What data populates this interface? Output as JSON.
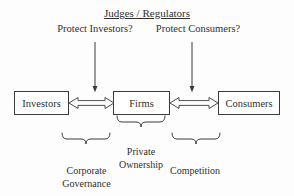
{
  "diagram": {
    "title": "Judges / Regulators",
    "type": "flow-diagram",
    "background_color": "#fdfdfd",
    "line_color": "#3a3a3a",
    "text_color": "#303030",
    "questions": [
      {
        "id": "investors-question",
        "text": "Protect Investors?"
      },
      {
        "id": "consumers-question",
        "text": "Protect Consumers?"
      }
    ],
    "boxes": [
      {
        "id": "investors",
        "label": "Investors"
      },
      {
        "id": "firms",
        "label": "Firms"
      },
      {
        "id": "consumers",
        "label": "Consumers"
      }
    ],
    "brace_labels": [
      {
        "id": "private-ownership",
        "line1": "Private",
        "line2": "Ownership"
      },
      {
        "id": "corporate-governance",
        "line1": "Corporate",
        "line2": "Governance"
      },
      {
        "id": "competition",
        "line1": "Competition",
        "line2": ""
      }
    ],
    "connectors": [
      {
        "id": "investors-firms-arrow",
        "kind": "double-headed-hollow-arrow"
      },
      {
        "id": "firms-consumers-arrow",
        "kind": "double-headed-hollow-arrow"
      },
      {
        "id": "regulator-to-investors-arrow",
        "kind": "down-arrow"
      },
      {
        "id": "regulator-to-consumers-arrow",
        "kind": "down-arrow"
      }
    ]
  }
}
